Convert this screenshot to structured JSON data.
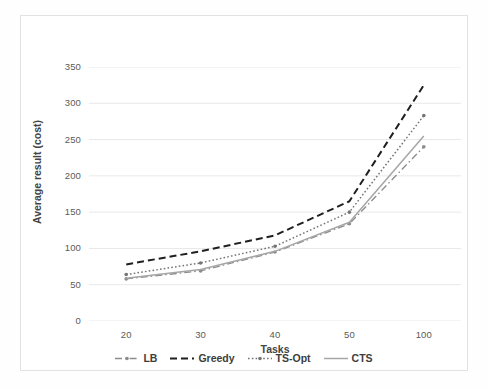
{
  "chart_data": {
    "type": "line",
    "title": "",
    "xlabel": "Tasks",
    "ylabel": "Average result (cost)",
    "categories": [
      "20",
      "30",
      "40",
      "50",
      "100"
    ],
    "x": [
      20,
      30,
      40,
      50,
      100
    ],
    "ylim": [
      0,
      350
    ],
    "y_ticks": [
      0,
      50,
      100,
      150,
      200,
      250,
      300,
      350
    ],
    "y_tick_labels": [
      "0",
      "50",
      "100",
      "150",
      "200",
      "250",
      "300",
      "350"
    ],
    "grid": "horizontal",
    "legend_position": "bottom",
    "series": [
      {
        "name": "LB",
        "values": [
          58,
          69,
          95,
          134,
          240
        ],
        "color": "#8c8c8c",
        "style": "dash-dot",
        "marker": "dot"
      },
      {
        "name": "Greedy",
        "values": [
          78,
          96,
          118,
          165,
          325
        ],
        "color": "#1f1f1f",
        "style": "dashed",
        "marker": "none"
      },
      {
        "name": "TS-Opt",
        "values": [
          64,
          80,
          103,
          150,
          283
        ],
        "color": "#757575",
        "style": "dotted",
        "marker": "dot"
      },
      {
        "name": "CTS",
        "values": [
          59,
          71,
          96,
          136,
          255
        ],
        "color": "#a6a6a6",
        "style": "solid",
        "marker": "none"
      }
    ]
  },
  "legend": {
    "items": [
      {
        "label": "LB",
        "icon": "line-dash-dot-icon"
      },
      {
        "label": "Greedy",
        "icon": "line-dashed-icon"
      },
      {
        "label": "TS-Opt",
        "icon": "line-dotted-icon"
      },
      {
        "label": "CTS",
        "icon": "line-solid-icon"
      }
    ]
  }
}
